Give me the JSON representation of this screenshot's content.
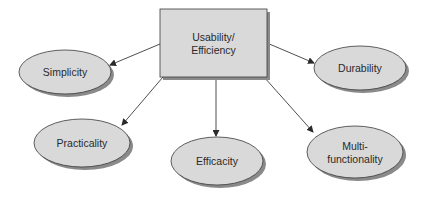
{
  "diagram": {
    "center": {
      "label_lines": [
        "Usability/",
        "Efficiency"
      ]
    },
    "nodes": [
      {
        "id": "simplicity",
        "label_lines": [
          "Simplicity"
        ]
      },
      {
        "id": "durability",
        "label_lines": [
          "Durability"
        ]
      },
      {
        "id": "practicality",
        "label_lines": [
          "Practicality"
        ]
      },
      {
        "id": "efficacity",
        "label_lines": [
          "Efficacity"
        ]
      },
      {
        "id": "multi-functionality",
        "label_lines": [
          "Multi-",
          "functionality"
        ]
      }
    ],
    "edges": [
      {
        "from": "center",
        "to": "simplicity"
      },
      {
        "from": "center",
        "to": "durability"
      },
      {
        "from": "center",
        "to": "practicality"
      },
      {
        "from": "center",
        "to": "efficacity"
      },
      {
        "from": "center",
        "to": "multi-functionality"
      }
    ],
    "colors": {
      "fill": "#d9d9d9",
      "stroke": "#3a3a3a",
      "shadow": "#8a8a8a",
      "edge": "#3a3a3a"
    }
  }
}
